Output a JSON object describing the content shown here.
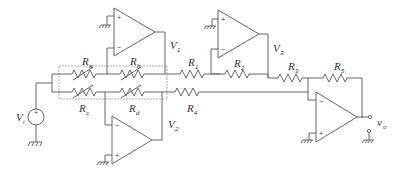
{
  "diagram": {
    "title": "",
    "type": "op-amp circuit schematic",
    "labels": {
      "Ra": {
        "main": "R",
        "sub": "a"
      },
      "Rb": {
        "main": "R",
        "sub": "b"
      },
      "Rc": {
        "main": "R",
        "sub": "c"
      },
      "Rd": {
        "main": "R",
        "sub": "d"
      },
      "R1": {
        "main": "R",
        "sub": "1"
      },
      "R2": {
        "main": "R",
        "sub": "2"
      },
      "R3": {
        "main": "R",
        "sub": "3"
      },
      "R4": {
        "main": "R",
        "sub": "4"
      },
      "R5": {
        "main": "R",
        "sub": "5"
      },
      "V1": {
        "main": "V",
        "sub": "1"
      },
      "V2": {
        "main": "V",
        "sub": "2"
      },
      "V3": {
        "main": "V",
        "sub": "3"
      },
      "Vi": {
        "main": "V",
        "sub": "i"
      },
      "vo": {
        "main": "v",
        "sub": "o"
      }
    },
    "opamp_terminals": {
      "plus": "+",
      "minus": "−"
    },
    "components": [
      {
        "id": "Ra",
        "kind": "variable-resistor"
      },
      {
        "id": "Rb",
        "kind": "variable-resistor"
      },
      {
        "id": "Rc",
        "kind": "variable-resistor"
      },
      {
        "id": "Rd",
        "kind": "variable-resistor"
      },
      {
        "id": "R1",
        "kind": "resistor"
      },
      {
        "id": "R2",
        "kind": "resistor"
      },
      {
        "id": "R3",
        "kind": "resistor"
      },
      {
        "id": "R4",
        "kind": "resistor"
      },
      {
        "id": "R5",
        "kind": "resistor"
      },
      {
        "id": "Vi",
        "kind": "voltage-source"
      },
      {
        "id": "A1",
        "kind": "op-amp",
        "output": "V1"
      },
      {
        "id": "A2",
        "kind": "op-amp",
        "output": "V2"
      },
      {
        "id": "A3",
        "kind": "op-amp",
        "output": "V3"
      },
      {
        "id": "A4",
        "kind": "op-amp",
        "output": "vo"
      }
    ]
  }
}
